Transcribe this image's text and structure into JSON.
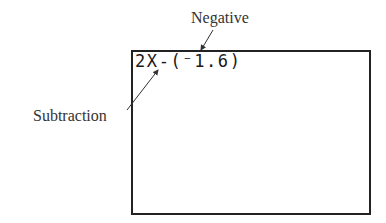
{
  "annotations": {
    "negative_label": "Negative",
    "subtraction_label": "Subtraction"
  },
  "calculator_screen": {
    "expression": "2X-(⁻1.6)"
  },
  "colors": {
    "border": "#222222",
    "text": "#333333",
    "background": "#ffffff"
  }
}
